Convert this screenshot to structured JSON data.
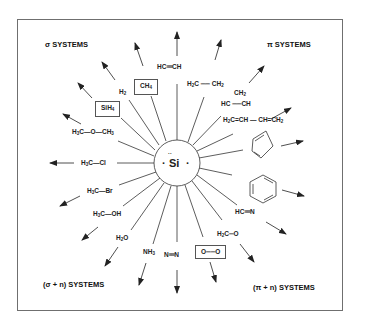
{
  "diagram": {
    "center": {
      "label": "Si",
      "dots_top": "··",
      "dot_left": "·",
      "dot_right": "·"
    },
    "categories": {
      "sigma": "σ SYSTEMS",
      "pi": "π SYSTEMS",
      "sigma_n": "(σ + n) SYSTEMS",
      "pi_n": "(π + n) SYSTEMS"
    },
    "molecules": {
      "hcch": {
        "a": "HC",
        "b": "CH"
      },
      "ch4": {
        "a": "CH",
        "s": "4"
      },
      "h2": {
        "a": "H",
        "s": "2"
      },
      "sih4": {
        "a": "SiH",
        "s": "4"
      },
      "dme": {
        "a": "H",
        "s1": "3",
        "b": "C—O—CH",
        "s2": "3"
      },
      "mecl": {
        "a": "H",
        "s": "3",
        "b": "C—Cl"
      },
      "mebr": {
        "a": "H",
        "s": "3",
        "b": "C—Br"
      },
      "meoh": {
        "a": "H",
        "s": "3",
        "b": "C—OH"
      },
      "h2o": {
        "a": "H",
        "s": "2",
        "b": "O"
      },
      "nh3": {
        "a": "NH",
        "s": "3"
      },
      "n2": {
        "a": "N",
        "b": "N"
      },
      "o2": {
        "a": "O",
        "b": "O"
      },
      "h2co": {
        "a": "H",
        "s": "2",
        "b": "C",
        "c": "O"
      },
      "hcn": {
        "a": "HC",
        "b": "N"
      },
      "ethene": {
        "a": "H",
        "s1": "2",
        "b": "C",
        "c": "CH",
        "s2": "2"
      },
      "cyclopropene": {
        "top": "CH",
        "ts": "2",
        "a": "HC",
        "b": "CH"
      },
      "butadiene": {
        "a": "H",
        "s1": "2",
        "b": "C=CH — CH=CH",
        "s2": "2"
      },
      "cyclopentadiene": "cyclopentadiene-ring",
      "benzene": "benzene-ring"
    },
    "colors": {
      "line": "#333333",
      "frame": "#6f6f6f",
      "text": "#222222"
    }
  }
}
